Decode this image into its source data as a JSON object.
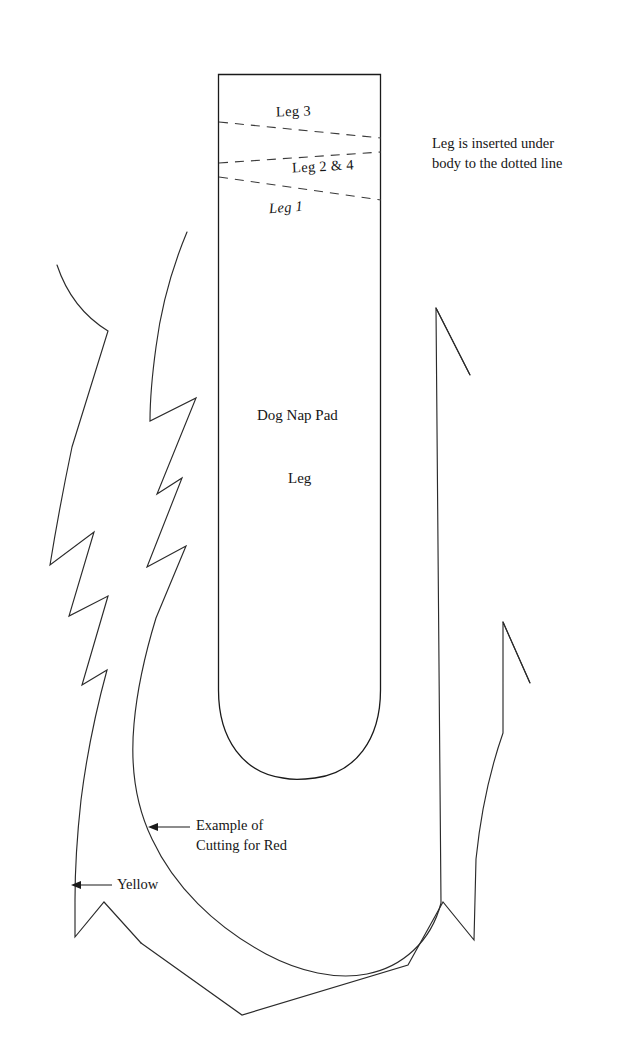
{
  "document": {
    "type": "sewing-pattern-diagram",
    "title": "Dog Nap Pad",
    "background_color": "#ffffff",
    "ink_color": "#1a1a1a",
    "width": 617,
    "height": 1051
  },
  "labels": {
    "leg_3": "Leg 3",
    "leg_2_and_4": "Leg 2 & 4",
    "leg_1": "Leg 1",
    "insert_note_line1": "Leg is inserted under",
    "insert_note_line2": "body to the dotted line",
    "dog_nap_pad": "Dog Nap Pad",
    "leg": "Leg",
    "example_red_line1": "Example of",
    "example_red_line2": "Cutting for Red",
    "yellow": "Yellow"
  },
  "annotations": [
    {
      "name": "example-cutting-for-red",
      "text": "Example of Cutting for Red",
      "arrow_direction": "left",
      "points_to": "inner-red-cut-line"
    },
    {
      "name": "yellow",
      "text": "Yellow",
      "arrow_direction": "left",
      "points_to": "outer-yellow-cut-line"
    }
  ],
  "dashed_lines": [
    {
      "name": "leg-3-dotted-line",
      "label": "Leg 3"
    },
    {
      "name": "leg-2-and-4-dotted-line",
      "label": "Leg 2 & 4"
    },
    {
      "name": "leg-1-dotted-line",
      "label": "Leg 1"
    }
  ],
  "shapes": {
    "body_outline": "u-shaped-pad-body",
    "outer_cut": "yellow-jagged-outline",
    "inner_cut": "red-jagged-outline"
  }
}
